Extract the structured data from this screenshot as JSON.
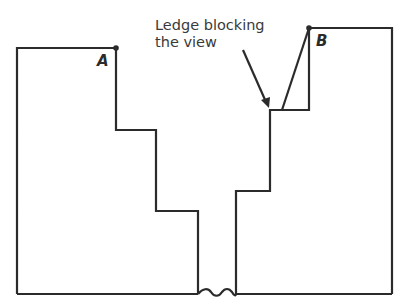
{
  "diagram": {
    "annotation": {
      "line1": "Ledge blocking",
      "line2": "the view"
    },
    "points": {
      "a": "A",
      "b": "B"
    },
    "stroke_color": "#2b2b2b",
    "text_color": "#3a3a3a"
  }
}
